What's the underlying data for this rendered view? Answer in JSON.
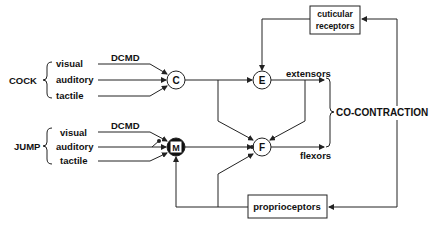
{
  "groups": {
    "cock": {
      "label": "COCK",
      "inputs": [
        "visual",
        "auditory",
        "tactile"
      ],
      "dcmd": "DCMD"
    },
    "jump": {
      "label": "JUMP",
      "inputs": [
        "visual",
        "auditory",
        "tactile"
      ],
      "dcmd": "DCMD"
    }
  },
  "nodes": {
    "c": "C",
    "e": "E",
    "f": "F",
    "m": "M"
  },
  "outputs": {
    "extensors": "extensors",
    "flexors": "flexors",
    "result": "CO-CONTRACTION"
  },
  "boxes": {
    "cuticular": [
      "cuticular",
      "receptors"
    ],
    "proprioceptors": "proprioceptors"
  },
  "colors": {
    "line": "#222222",
    "bg": "#ffffff",
    "m_fill": "#111111"
  }
}
